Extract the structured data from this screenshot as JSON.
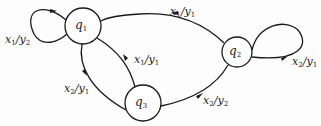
{
  "diagram": {
    "type": "state-transition-diagram",
    "states": [
      {
        "id": "q1",
        "name": "q",
        "sub": "1",
        "cx": 83,
        "cy": 26,
        "r": 18
      },
      {
        "id": "q2",
        "name": "q",
        "sub": "2",
        "cx": 237,
        "cy": 52,
        "r": 15
      },
      {
        "id": "q3",
        "name": "q",
        "sub": "3",
        "cx": 143,
        "cy": 103,
        "r": 18
      }
    ],
    "transitions": [
      {
        "id": "q1-self",
        "from": "q1",
        "to": "q1",
        "input": "x",
        "input_sub": "1",
        "output": "y",
        "output_sub": "2",
        "label_x": 5,
        "label_y": 34
      },
      {
        "id": "q2-q1",
        "from": "q2",
        "to": "q1",
        "input": "x",
        "input_sub": "1",
        "output": "y",
        "output_sub": "1",
        "label_x": 170,
        "label_y": 6
      },
      {
        "id": "q3-q1",
        "from": "q3",
        "to": "q1",
        "input": "x",
        "input_sub": "1",
        "output": "y",
        "output_sub": "1",
        "label_x": 134,
        "label_y": 54
      },
      {
        "id": "q1-q3",
        "from": "q1",
        "to": "q3",
        "input": "x",
        "input_sub": "2",
        "output": "y",
        "output_sub": "1",
        "label_x": 64,
        "label_y": 83
      },
      {
        "id": "q3-q2",
        "from": "q3",
        "to": "q2",
        "input": "x",
        "input_sub": "2",
        "output": "y",
        "output_sub": "2",
        "label_x": 203,
        "label_y": 95
      },
      {
        "id": "q2-self",
        "from": "q2",
        "to": "q2",
        "input": "x",
        "input_sub": "2",
        "output": "y",
        "output_sub": "1",
        "label_x": 292,
        "label_y": 56
      }
    ],
    "line_color": "#1a1a1a"
  }
}
